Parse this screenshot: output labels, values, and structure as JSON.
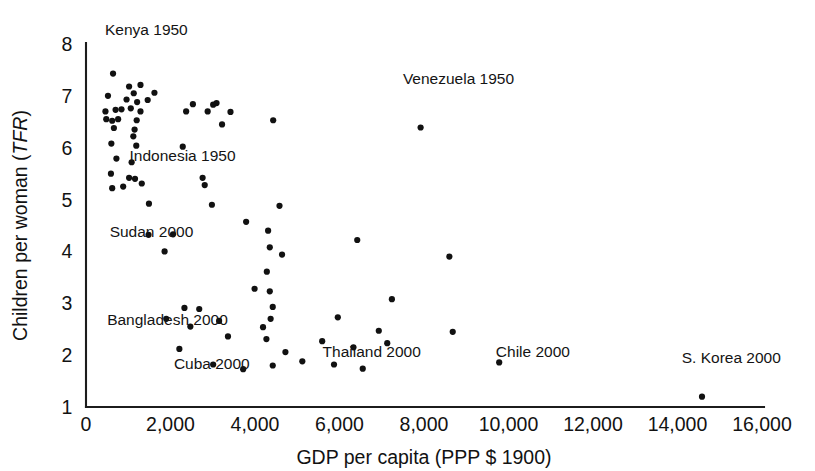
{
  "chart_data": {
    "type": "scatter",
    "title": "",
    "xlabel": "GDP per capita (PPP $ 1900)",
    "ylabel": "Children per woman (TFR)",
    "ylabel_plain": "Children per woman (",
    "ylabel_italic": "TFR",
    "ylabel_tail": ")",
    "xlim": [
      0,
      16000
    ],
    "ylim": [
      1,
      8
    ],
    "grid": false,
    "legend": "none",
    "xticks": [
      0,
      2000,
      4000,
      6000,
      8000,
      10000,
      12000,
      14000,
      16000
    ],
    "xtick_labels": [
      "0",
      "2,000",
      "4,000",
      "6,000",
      "8,000",
      "10,000",
      "12,000",
      "14,000",
      "16,000"
    ],
    "yticks": [
      1,
      2,
      3,
      4,
      5,
      6,
      7,
      8
    ],
    "ytick_labels": [
      "1",
      "2",
      "3",
      "4",
      "5",
      "6",
      "7",
      "8"
    ],
    "point_color": "#111111",
    "annotations": [
      {
        "text": "Kenya 1950",
        "x": 450,
        "y": 8.18
      },
      {
        "text": "Indonesia 1950",
        "x": 1030,
        "y": 5.75
      },
      {
        "text": "Sudan 2000",
        "x": 560,
        "y": 4.27
      },
      {
        "text": "Bangladesh 2000",
        "x": 500,
        "y": 2.58
      },
      {
        "text": "Cuba 2000",
        "x": 2080,
        "y": 1.73
      },
      {
        "text": "Thailand 2000",
        "x": 5600,
        "y": 1.96
      },
      {
        "text": "Venezuela 1950",
        "x": 7500,
        "y": 7.22
      },
      {
        "text": "Chile 2000",
        "x": 9700,
        "y": 1.96
      },
      {
        "text": "S. Korea 2000",
        "x": 14100,
        "y": 1.85
      }
    ],
    "points": [
      {
        "x": 640,
        "y": 7.43
      },
      {
        "x": 1020,
        "y": 7.18
      },
      {
        "x": 1290,
        "y": 7.21
      },
      {
        "x": 520,
        "y": 7.0
      },
      {
        "x": 1130,
        "y": 7.05
      },
      {
        "x": 1620,
        "y": 7.06
      },
      {
        "x": 960,
        "y": 6.93
      },
      {
        "x": 1210,
        "y": 6.88
      },
      {
        "x": 1460,
        "y": 6.92
      },
      {
        "x": 2530,
        "y": 6.84
      },
      {
        "x": 3010,
        "y": 6.83
      },
      {
        "x": 3090,
        "y": 6.86
      },
      {
        "x": 460,
        "y": 6.7
      },
      {
        "x": 700,
        "y": 6.73
      },
      {
        "x": 840,
        "y": 6.74
      },
      {
        "x": 1060,
        "y": 6.76
      },
      {
        "x": 1290,
        "y": 6.7
      },
      {
        "x": 2370,
        "y": 6.7
      },
      {
        "x": 2880,
        "y": 6.7
      },
      {
        "x": 3420,
        "y": 6.69
      },
      {
        "x": 480,
        "y": 6.55
      },
      {
        "x": 620,
        "y": 6.52
      },
      {
        "x": 760,
        "y": 6.55
      },
      {
        "x": 1200,
        "y": 6.53
      },
      {
        "x": 4430,
        "y": 6.53
      },
      {
        "x": 7920,
        "y": 6.39
      },
      {
        "x": 3220,
        "y": 6.45
      },
      {
        "x": 660,
        "y": 6.38
      },
      {
        "x": 1150,
        "y": 6.35
      },
      {
        "x": 1120,
        "y": 6.22
      },
      {
        "x": 600,
        "y": 6.08
      },
      {
        "x": 1190,
        "y": 6.04
      },
      {
        "x": 2290,
        "y": 6.02
      },
      {
        "x": 720,
        "y": 5.79
      },
      {
        "x": 1080,
        "y": 5.72
      },
      {
        "x": 590,
        "y": 5.5
      },
      {
        "x": 1020,
        "y": 5.42
      },
      {
        "x": 1160,
        "y": 5.4
      },
      {
        "x": 1320,
        "y": 5.31
      },
      {
        "x": 2760,
        "y": 5.42
      },
      {
        "x": 2810,
        "y": 5.28
      },
      {
        "x": 620,
        "y": 5.22
      },
      {
        "x": 880,
        "y": 5.25
      },
      {
        "x": 1490,
        "y": 4.92
      },
      {
        "x": 2980,
        "y": 4.9
      },
      {
        "x": 4580,
        "y": 4.88
      },
      {
        "x": 1480,
        "y": 4.32
      },
      {
        "x": 2060,
        "y": 4.33
      },
      {
        "x": 3790,
        "y": 4.57
      },
      {
        "x": 4310,
        "y": 4.4
      },
      {
        "x": 6420,
        "y": 4.22
      },
      {
        "x": 4350,
        "y": 4.08
      },
      {
        "x": 1860,
        "y": 4.0
      },
      {
        "x": 4640,
        "y": 3.94
      },
      {
        "x": 8600,
        "y": 3.9
      },
      {
        "x": 4280,
        "y": 3.61
      },
      {
        "x": 3990,
        "y": 3.28
      },
      {
        "x": 4350,
        "y": 3.23
      },
      {
        "x": 7240,
        "y": 3.08
      },
      {
        "x": 2330,
        "y": 2.91
      },
      {
        "x": 2680,
        "y": 2.89
      },
      {
        "x": 4420,
        "y": 2.93
      },
      {
        "x": 5960,
        "y": 2.73
      },
      {
        "x": 1900,
        "y": 2.7
      },
      {
        "x": 3150,
        "y": 2.66
      },
      {
        "x": 4370,
        "y": 2.7
      },
      {
        "x": 2470,
        "y": 2.55
      },
      {
        "x": 4190,
        "y": 2.54
      },
      {
        "x": 6930,
        "y": 2.47
      },
      {
        "x": 8680,
        "y": 2.45
      },
      {
        "x": 3360,
        "y": 2.36
      },
      {
        "x": 4270,
        "y": 2.31
      },
      {
        "x": 5590,
        "y": 2.27
      },
      {
        "x": 6330,
        "y": 2.15
      },
      {
        "x": 7130,
        "y": 2.23
      },
      {
        "x": 2210,
        "y": 2.12
      },
      {
        "x": 4720,
        "y": 2.06
      },
      {
        "x": 3010,
        "y": 1.82
      },
      {
        "x": 3720,
        "y": 1.73
      },
      {
        "x": 4420,
        "y": 1.8
      },
      {
        "x": 5120,
        "y": 1.88
      },
      {
        "x": 5870,
        "y": 1.82
      },
      {
        "x": 6550,
        "y": 1.74
      },
      {
        "x": 9780,
        "y": 1.86
      },
      {
        "x": 14580,
        "y": 1.2
      }
    ]
  }
}
